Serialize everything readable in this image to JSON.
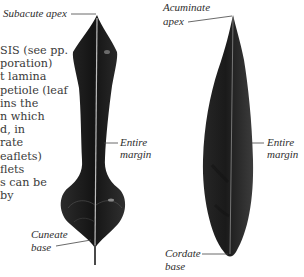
{
  "body_text": {
    "lines": [
      "SIS (see pp.",
      "poration)",
      "t lamina",
      "petiole (leaf",
      "ins the",
      "n which",
      "d, in",
      "rate",
      "eaflets)",
      "flets",
      "s can be",
      "by"
    ]
  },
  "left_leaf": {
    "apex_label": "Subacute apex",
    "margin_label_line1": "Entire",
    "margin_label_line2": "margin",
    "base_label_line1": "Cuneate",
    "base_label_line2": "base"
  },
  "right_leaf": {
    "apex_label_line1": "Acuminate",
    "apex_label_line2": "apex",
    "margin_label_line1": "Entire",
    "margin_label_line2": "margin",
    "base_label_line1": "Cordate",
    "base_label_line2": "base"
  },
  "colors": {
    "leaf_dark": "#1c1c1c",
    "leaf_mid": "#3a3a3a",
    "midrib": "#bdbdbd",
    "leader_line": "#444444"
  }
}
